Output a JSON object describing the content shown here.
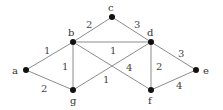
{
  "graph": {
    "nodes": [
      {
        "id": "a",
        "label": "a",
        "x": 26,
        "y": 70
      },
      {
        "id": "b",
        "label": "b",
        "x": 73,
        "y": 42
      },
      {
        "id": "c",
        "label": "c",
        "x": 112,
        "y": 17
      },
      {
        "id": "d",
        "label": "d",
        "x": 151,
        "y": 42
      },
      {
        "id": "e",
        "label": "e",
        "x": 196,
        "y": 70
      },
      {
        "id": "f",
        "label": "f",
        "x": 151,
        "y": 90
      },
      {
        "id": "g",
        "label": "g",
        "x": 73,
        "y": 90
      }
    ],
    "edges": [
      {
        "from": "a",
        "to": "b",
        "weight": "1"
      },
      {
        "from": "a",
        "to": "g",
        "weight": "2"
      },
      {
        "from": "b",
        "to": "c",
        "weight": "2"
      },
      {
        "from": "c",
        "to": "d",
        "weight": "3"
      },
      {
        "from": "b",
        "to": "d",
        "weight": "1"
      },
      {
        "from": "b",
        "to": "g",
        "weight": "1"
      },
      {
        "from": "b",
        "to": "f",
        "weight": "4"
      },
      {
        "from": "g",
        "to": "d",
        "weight": "1"
      },
      {
        "from": "d",
        "to": "f",
        "weight": "2"
      },
      {
        "from": "d",
        "to": "e",
        "weight": "3"
      },
      {
        "from": "f",
        "to": "e",
        "weight": "4"
      }
    ]
  }
}
